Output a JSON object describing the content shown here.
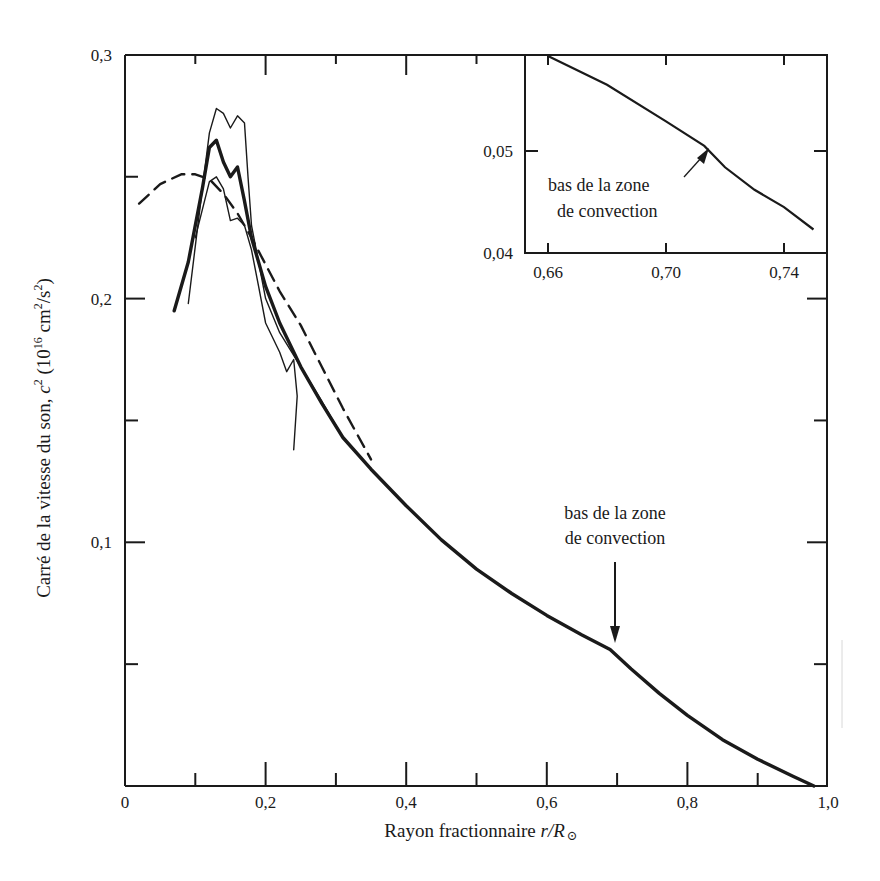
{
  "chart_data": {
    "type": "line",
    "title": "",
    "xlabel": "Rayon fractionnaire r/R⊙",
    "ylabel": "Carré de la vitesse du son, c² (10¹⁶ cm²/s²)",
    "xlim": [
      0,
      1.0
    ],
    "ylim": [
      0,
      0.3
    ],
    "grid": false,
    "x_ticks": [
      "0",
      "0,2",
      "0,4",
      "0,6",
      "0,8",
      "1,0"
    ],
    "y_ticks": [
      "0,1",
      "0,2",
      "0,3"
    ],
    "series": [
      {
        "name": "model (thick solid)",
        "style": "thick-solid",
        "x": [
          0.07,
          0.09,
          0.11,
          0.12,
          0.13,
          0.14,
          0.15,
          0.16,
          0.17,
          0.18,
          0.2,
          0.22,
          0.25,
          0.28,
          0.31,
          0.35,
          0.4,
          0.45,
          0.5,
          0.55,
          0.6,
          0.65,
          0.69,
          0.72,
          0.76,
          0.8,
          0.85,
          0.9,
          0.95,
          0.98
        ],
        "y": [
          0.195,
          0.215,
          0.245,
          0.262,
          0.265,
          0.256,
          0.25,
          0.254,
          0.24,
          0.225,
          0.205,
          0.19,
          0.172,
          0.157,
          0.143,
          0.13,
          0.115,
          0.101,
          0.089,
          0.079,
          0.07,
          0.062,
          0.056,
          0.048,
          0.038,
          0.029,
          0.019,
          0.011,
          0.004,
          0.0
        ]
      },
      {
        "name": "thin solid (upper)",
        "style": "thin-solid",
        "x": [
          0.09,
          0.11,
          0.12,
          0.13,
          0.14,
          0.15,
          0.16,
          0.17,
          0.175,
          0.18,
          0.19,
          0.2,
          0.22,
          0.25,
          0.28,
          0.31
        ],
        "y": [
          0.198,
          0.245,
          0.268,
          0.278,
          0.276,
          0.27,
          0.275,
          0.272,
          0.25,
          0.23,
          0.215,
          0.2,
          0.186,
          0.172,
          0.158,
          0.143
        ]
      },
      {
        "name": "thin solid (lower, wavy)",
        "style": "thin-solid",
        "x": [
          0.1,
          0.12,
          0.13,
          0.14,
          0.15,
          0.16,
          0.17,
          0.18,
          0.19,
          0.2,
          0.22,
          0.23,
          0.24,
          0.245,
          0.24
        ],
        "y": [
          0.225,
          0.248,
          0.25,
          0.245,
          0.232,
          0.233,
          0.23,
          0.22,
          0.205,
          0.19,
          0.178,
          0.17,
          0.175,
          0.16,
          0.138
        ]
      },
      {
        "name": "dashed",
        "style": "dashed",
        "x": [
          0.02,
          0.05,
          0.08,
          0.1,
          0.12,
          0.14,
          0.16,
          0.18,
          0.2,
          0.22,
          0.25,
          0.28,
          0.31,
          0.35
        ],
        "y": [
          0.239,
          0.247,
          0.251,
          0.251,
          0.249,
          0.243,
          0.235,
          0.225,
          0.214,
          0.203,
          0.189,
          0.172,
          0.155,
          0.134
        ]
      }
    ],
    "annotations": [
      {
        "text_line1": "bas de la zone",
        "text_line2": "de convection",
        "x": 0.69,
        "y": 0.056,
        "arrow": "down"
      }
    ],
    "inset": {
      "type": "line",
      "xlim": [
        0.655,
        0.75
      ],
      "ylim": [
        0.04,
        0.06
      ],
      "x_ticks": [
        "0,66",
        "0,70",
        "0,74"
      ],
      "y_ticks": [
        "0,04",
        "0,05"
      ],
      "series": [
        {
          "name": "model",
          "x": [
            0.66,
            0.68,
            0.7,
            0.713,
            0.72,
            0.73,
            0.74,
            0.75
          ],
          "y": [
            0.0599,
            0.0565,
            0.0529,
            0.0505,
            0.0484,
            0.0462,
            0.0445,
            0.0423
          ]
        }
      ],
      "annotation": {
        "text_line1": "bas de la zone",
        "text_line2": "de convection",
        "x": 0.713,
        "y": 0.0505
      }
    }
  },
  "axes": {
    "x_ticks": [
      {
        "v": 0,
        "label": "0"
      },
      {
        "v": 0.2,
        "label": "0,2"
      },
      {
        "v": 0.4,
        "label": "0,4"
      },
      {
        "v": 0.6,
        "label": "0,6"
      },
      {
        "v": 0.8,
        "label": "0,8"
      },
      {
        "v": 1.0,
        "label": "1,0"
      }
    ],
    "y_ticks": [
      {
        "v": 0.1,
        "label": "0,1"
      },
      {
        "v": 0.2,
        "label": "0,2"
      },
      {
        "v": 0.3,
        "label": "0,3"
      }
    ],
    "xlabel_main": "Rayon fractionnaire ",
    "xlabel_italic": "r/R",
    "xlabel_sub": "⊙",
    "ylabel_main": "Carré de la vitesse du son, ",
    "ylabel_italic": "c",
    "ylabel_sup": "2",
    "ylabel_unit_a": " (10",
    "ylabel_unit_sup": "16",
    "ylabel_unit_b": " cm",
    "ylabel_unit_sup2": "2",
    "ylabel_unit_c": "/s",
    "ylabel_unit_sup3": "2",
    "ylabel_unit_d": ")"
  },
  "annotation_main": {
    "line1": "bas de la zone",
    "line2": "de convection"
  },
  "annotation_inset": {
    "line1": "bas de la zone",
    "line2": "de convection"
  },
  "inset_ticks": {
    "x": [
      {
        "v": 0.66,
        "label": "0,66"
      },
      {
        "v": 0.7,
        "label": "0,70"
      },
      {
        "v": 0.74,
        "label": "0,74"
      }
    ],
    "y": [
      {
        "v": 0.04,
        "label": "0,04"
      },
      {
        "v": 0.05,
        "label": "0,05"
      }
    ]
  },
  "colors": {
    "ink": "#1a1a1a",
    "background": "#ffffff"
  }
}
